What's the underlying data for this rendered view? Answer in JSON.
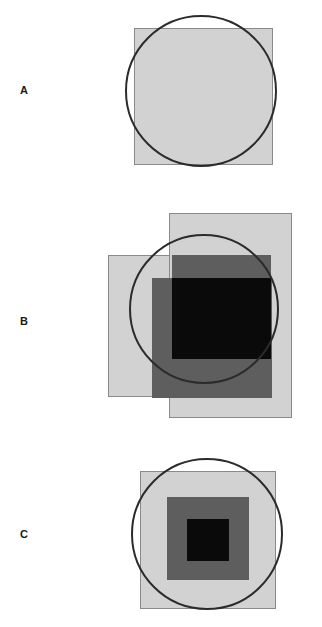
{
  "figure": {
    "width": 322,
    "height": 627,
    "background": "#ffffff"
  },
  "palette": {
    "light_gray_fill": "#d2d2d2",
    "medium_gray_fill": "#5e5e5e",
    "dark_fill": "#0a0a0a",
    "square_stroke": "#8a8a8a",
    "circle_stroke": "#2b2b2b",
    "label_color": "#1a1a1a"
  },
  "panels": [
    {
      "label": "A",
      "label_x": 24,
      "label_y": 91,
      "shapes": [
        {
          "kind": "square",
          "name": "light-square",
          "x": 134,
          "y": 28,
          "width": 139,
          "height": 137,
          "fill": "#d2d2d2",
          "stroke": "#8a8a8a"
        },
        {
          "kind": "circle",
          "name": "outline-circle",
          "x": 125,
          "y": 15,
          "width": 152,
          "height": 152,
          "fill": "none",
          "stroke": "#2b2b2b"
        }
      ]
    },
    {
      "label": "B",
      "label_x": 24,
      "label_y": 322,
      "shapes": [
        {
          "kind": "square",
          "name": "light-square-left",
          "x": 108,
          "y": 255,
          "width": 138,
          "height": 142,
          "fill": "#d2d2d2",
          "stroke": "#8a8a8a"
        },
        {
          "kind": "square",
          "name": "light-square-right",
          "x": 169,
          "y": 213,
          "width": 123,
          "height": 205,
          "fill": "#d2d2d2",
          "stroke": "#8a8a8a"
        },
        {
          "kind": "square",
          "name": "medium-square-upper",
          "x": 172,
          "y": 255,
          "width": 99,
          "height": 104,
          "fill": "#5e5e5e",
          "stroke": "#5e5e5e"
        },
        {
          "kind": "square",
          "name": "medium-square-lower",
          "x": 152,
          "y": 278,
          "width": 120,
          "height": 120,
          "fill": "#5e5e5e",
          "stroke": "#5e5e5e"
        },
        {
          "kind": "square",
          "name": "dark-intersection-square",
          "x": 172,
          "y": 278,
          "width": 99,
          "height": 81,
          "fill": "#0a0a0a",
          "stroke": "#0a0a0a"
        },
        {
          "kind": "circle",
          "name": "outline-circle",
          "x": 129,
          "y": 234,
          "width": 150,
          "height": 150,
          "fill": "none",
          "stroke": "#2b2b2b"
        }
      ]
    },
    {
      "label": "C",
      "label_x": 24,
      "label_y": 535,
      "shapes": [
        {
          "kind": "square",
          "name": "light-square-outer",
          "x": 140,
          "y": 471,
          "width": 136,
          "height": 138,
          "fill": "#d2d2d2",
          "stroke": "#8a8a8a"
        },
        {
          "kind": "square",
          "name": "medium-square-middle",
          "x": 167,
          "y": 497,
          "width": 82,
          "height": 83,
          "fill": "#5e5e5e",
          "stroke": "#5e5e5e"
        },
        {
          "kind": "square",
          "name": "dark-square-inner",
          "x": 187,
          "y": 519,
          "width": 42,
          "height": 42,
          "fill": "#0a0a0a",
          "stroke": "#0a0a0a"
        },
        {
          "kind": "circle",
          "name": "outline-circle",
          "x": 131,
          "y": 458,
          "width": 152,
          "height": 152,
          "fill": "none",
          "stroke": "#2b2b2b"
        }
      ]
    }
  ]
}
